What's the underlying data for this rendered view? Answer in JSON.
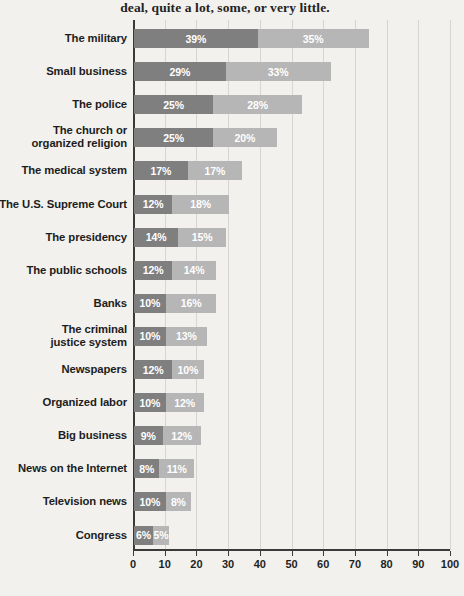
{
  "caption": "deal, quite a lot, some, or very little.",
  "chart_data": {
    "type": "bar",
    "subtype": "stacked-horizontal",
    "title": "",
    "subtitle": "deal, quite a lot, some, or very little.",
    "xlabel": "",
    "ylabel": "",
    "xlim": [
      0,
      100
    ],
    "xticks": [
      0,
      10,
      20,
      30,
      40,
      50,
      60,
      70,
      80,
      90,
      100
    ],
    "grid": true,
    "legend": "none",
    "value_suffix": "%",
    "colors": {
      "background": "#f2f1ed",
      "series_a": "#7f7f7f",
      "series_b": "#b6b6b6",
      "axis": "#3a3a3a",
      "gridline": "#d6d5d1",
      "text": "#1d1d1d",
      "value_text": "#ffffff"
    },
    "series": [
      {
        "name": "A great deal",
        "values": [
          39,
          29,
          25,
          25,
          17,
          12,
          14,
          12,
          10,
          10,
          12,
          10,
          9,
          8,
          10,
          6
        ]
      },
      {
        "name": "Quite a lot",
        "values": [
          35,
          33,
          28,
          20,
          17,
          18,
          15,
          14,
          16,
          13,
          10,
          12,
          12,
          11,
          8,
          5
        ]
      }
    ],
    "categories": [
      "The military",
      "Small business",
      "The police",
      "The church or organized religion",
      "The medical system",
      "The U.S. Supreme Court",
      "The presidency",
      "The public schools",
      "Banks",
      "The criminal justice system",
      "Newspapers",
      "Organized labor",
      "Big business",
      "News on the Internet",
      "Television news",
      "Congress"
    ],
    "rows": [
      {
        "label": [
          "The military"
        ],
        "a": 39,
        "b": 35,
        "a_text": "39%",
        "b_text": "35%"
      },
      {
        "label": [
          "Small business"
        ],
        "a": 29,
        "b": 33,
        "a_text": "29%",
        "b_text": "33%"
      },
      {
        "label": [
          "The police"
        ],
        "a": 25,
        "b": 28,
        "a_text": "25%",
        "b_text": "28%"
      },
      {
        "label": [
          "The church or",
          "organized religion"
        ],
        "a": 25,
        "b": 20,
        "a_text": "25%",
        "b_text": "20%"
      },
      {
        "label": [
          "The medical system"
        ],
        "a": 17,
        "b": 17,
        "a_text": "17%",
        "b_text": "17%"
      },
      {
        "label": [
          "The U.S. Supreme Court"
        ],
        "a": 12,
        "b": 18,
        "a_text": "12%",
        "b_text": "18%"
      },
      {
        "label": [
          "The presidency"
        ],
        "a": 14,
        "b": 15,
        "a_text": "14%",
        "b_text": "15%"
      },
      {
        "label": [
          "The public schools"
        ],
        "a": 12,
        "b": 14,
        "a_text": "12%",
        "b_text": "14%"
      },
      {
        "label": [
          "Banks"
        ],
        "a": 10,
        "b": 16,
        "a_text": "10%",
        "b_text": "16%"
      },
      {
        "label": [
          "The criminal",
          "justice system"
        ],
        "a": 10,
        "b": 13,
        "a_text": "10%",
        "b_text": "13%"
      },
      {
        "label": [
          "Newspapers"
        ],
        "a": 12,
        "b": 10,
        "a_text": "12%",
        "b_text": "10%"
      },
      {
        "label": [
          "Organized labor"
        ],
        "a": 10,
        "b": 12,
        "a_text": "10%",
        "b_text": "12%"
      },
      {
        "label": [
          "Big business"
        ],
        "a": 9,
        "b": 12,
        "a_text": "9%",
        "b_text": "12%"
      },
      {
        "label": [
          "News on the Internet"
        ],
        "a": 8,
        "b": 11,
        "a_text": "8%",
        "b_text": "11%"
      },
      {
        "label": [
          "Television news"
        ],
        "a": 10,
        "b": 8,
        "a_text": "10%",
        "b_text": "8%"
      },
      {
        "label": [
          "Congress"
        ],
        "a": 6,
        "b": 5,
        "a_text": "6%",
        "b_text": "5%"
      }
    ],
    "xtick_labels": [
      "0",
      "10",
      "20",
      "30",
      "40",
      "50",
      "60",
      "70",
      "80",
      "90",
      "100"
    ]
  }
}
